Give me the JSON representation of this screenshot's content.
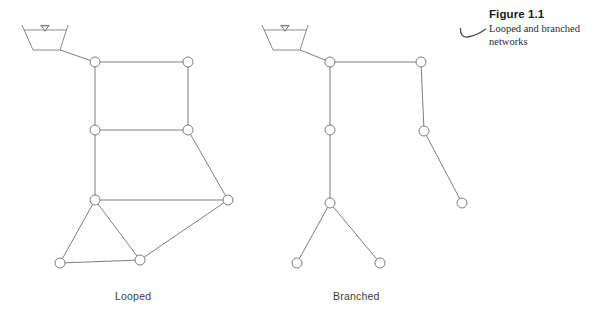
{
  "figure": {
    "caption_title": "Figure 1.1",
    "caption_body": "Looped and branched networks",
    "swoosh_icon": "curved-swoosh-icon",
    "background_color": "#ffffff",
    "line_color": "#7e7e7e",
    "node_fill_color": "#ffffff",
    "label_color": "#3d3d3d"
  },
  "networks": [
    {
      "id": "looped",
      "label": "Looped",
      "label_position": {
        "x": 115,
        "y": 290
      },
      "source": {
        "type": "reservoir",
        "name": "reservoir-looped",
        "top_left": {
          "x": 22,
          "y": 25
        },
        "top_right": {
          "x": 68,
          "y": 25
        },
        "bottom_left": {
          "x": 33,
          "y": 50
        },
        "bottom_right": {
          "x": 60,
          "y": 50
        },
        "waterline_y": 30,
        "marker": {
          "x": 45,
          "y": 27
        }
      },
      "nodes": [
        {
          "id": "L1",
          "x": 95,
          "y": 62,
          "r": 5
        },
        {
          "id": "L2",
          "x": 188,
          "y": 62,
          "r": 5
        },
        {
          "id": "L3",
          "x": 95,
          "y": 130,
          "r": 5
        },
        {
          "id": "L4",
          "x": 188,
          "y": 130,
          "r": 5
        },
        {
          "id": "L5",
          "x": 95,
          "y": 200,
          "r": 5
        },
        {
          "id": "L6",
          "x": 228,
          "y": 200,
          "r": 5
        },
        {
          "id": "L7",
          "x": 60,
          "y": 263,
          "r": 5
        },
        {
          "id": "L8",
          "x": 140,
          "y": 260,
          "r": 5
        }
      ],
      "edges": [
        {
          "from": "reservoir",
          "to": "L1"
        },
        {
          "from": "L1",
          "to": "L2"
        },
        {
          "from": "L1",
          "to": "L3"
        },
        {
          "from": "L2",
          "to": "L4"
        },
        {
          "from": "L3",
          "to": "L4"
        },
        {
          "from": "L3",
          "to": "L5"
        },
        {
          "from": "L4",
          "to": "L6"
        },
        {
          "from": "L5",
          "to": "L6"
        },
        {
          "from": "L5",
          "to": "L7"
        },
        {
          "from": "L5",
          "to": "L8"
        },
        {
          "from": "L7",
          "to": "L8"
        },
        {
          "from": "L8",
          "to": "L6"
        }
      ],
      "loop_count": 3
    },
    {
      "id": "branched",
      "label": "Branched",
      "label_position": {
        "x": 333,
        "y": 290
      },
      "source": {
        "type": "reservoir",
        "name": "reservoir-branched",
        "top_left": {
          "x": 262,
          "y": 25
        },
        "top_right": {
          "x": 308,
          "y": 25
        },
        "bottom_left": {
          "x": 273,
          "y": 50
        },
        "bottom_right": {
          "x": 300,
          "y": 50
        },
        "waterline_y": 30,
        "marker": {
          "x": 285,
          "y": 27
        }
      },
      "nodes": [
        {
          "id": "B1",
          "x": 330,
          "y": 62,
          "r": 5
        },
        {
          "id": "B2",
          "x": 421,
          "y": 62,
          "r": 5
        },
        {
          "id": "B3",
          "x": 330,
          "y": 130,
          "r": 5
        },
        {
          "id": "B4",
          "x": 424,
          "y": 131,
          "r": 5
        },
        {
          "id": "B5",
          "x": 330,
          "y": 203,
          "r": 5
        },
        {
          "id": "B6",
          "x": 462,
          "y": 203,
          "r": 5
        },
        {
          "id": "B7",
          "x": 297,
          "y": 263,
          "r": 5
        },
        {
          "id": "B8",
          "x": 380,
          "y": 263,
          "r": 5
        }
      ],
      "edges": [
        {
          "from": "reservoir",
          "to": "B1"
        },
        {
          "from": "B1",
          "to": "B2"
        },
        {
          "from": "B1",
          "to": "B3"
        },
        {
          "from": "B2",
          "to": "B4"
        },
        {
          "from": "B3",
          "to": "B5"
        },
        {
          "from": "B4",
          "to": "B6"
        },
        {
          "from": "B5",
          "to": "B7"
        },
        {
          "from": "B5",
          "to": "B8"
        }
      ],
      "loop_count": 0
    }
  ]
}
